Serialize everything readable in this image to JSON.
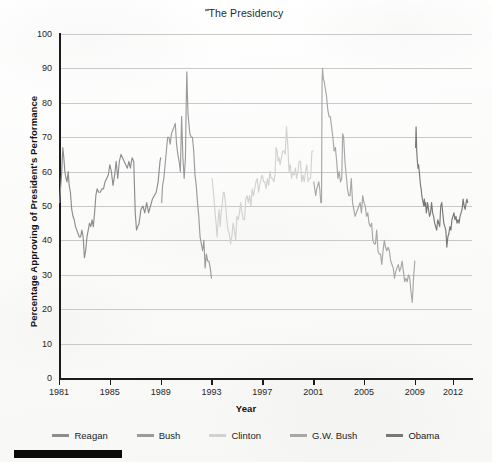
{
  "chart_title": "The Presidency",
  "axes": {
    "y_title": "Percentage Approving of President's Performance",
    "x_title": "Year",
    "y_ticks": [
      "0",
      "10",
      "20",
      "30",
      "40",
      "50",
      "60",
      "70",
      "80",
      "90",
      "100"
    ],
    "x_ticks": [
      "1981",
      "1985",
      "1989",
      "1993",
      "1997",
      "2001",
      "2005",
      "2009",
      "2012"
    ]
  },
  "legend": {
    "items": [
      {
        "label": "Reagan",
        "color": "#8d8d8d"
      },
      {
        "label": "Bush",
        "color": "#9b9b9b"
      },
      {
        "label": "Clinton",
        "color": "#d2d2d2"
      },
      {
        "label": "G.W. Bush",
        "color": "#a7a7a7"
      },
      {
        "label": "Obama",
        "color": "#787878"
      }
    ]
  },
  "chart_data": {
    "type": "line",
    "title": "The Presidency",
    "xlabel": "Year",
    "ylabel": "Percentage Approving of President's Performance",
    "xlim": [
      1981,
      2013.5
    ],
    "ylim": [
      0,
      100
    ],
    "grid": true,
    "legend_position": "bottom",
    "x_tick_values": [
      1981,
      1985,
      1989,
      1993,
      1997,
      2001,
      2005,
      2009,
      2012
    ],
    "y_tick_values": [
      0,
      10,
      20,
      30,
      40,
      50,
      60,
      70,
      80,
      90,
      100
    ],
    "series": [
      {
        "name": "Reagan",
        "color": "#8d8d8d",
        "x": [
          1981.05,
          1981.12,
          1981.2,
          1981.3,
          1981.38,
          1981.46,
          1981.55,
          1981.63,
          1981.72,
          1981.8,
          1981.9,
          1982.0,
          1982.1,
          1982.2,
          1982.3,
          1982.4,
          1982.5,
          1982.6,
          1982.7,
          1982.8,
          1982.9,
          1983.0,
          1983.1,
          1983.2,
          1983.3,
          1983.4,
          1983.5,
          1983.6,
          1983.7,
          1983.8,
          1983.9,
          1984.0,
          1984.12,
          1984.25,
          1984.38,
          1984.5,
          1984.62,
          1984.75,
          1984.88,
          1985.0,
          1985.12,
          1985.25,
          1985.38,
          1985.5,
          1985.62,
          1985.75,
          1985.88,
          1986.0,
          1986.12,
          1986.25,
          1986.38,
          1986.5,
          1986.62,
          1986.75,
          1986.88,
          1987.0,
          1987.1,
          1987.2,
          1987.3,
          1987.45,
          1987.6,
          1987.75,
          1987.9,
          1988.05,
          1988.2,
          1988.35,
          1988.5,
          1988.65,
          1988.8,
          1988.95,
          1989.0
        ],
        "y": [
          51,
          55,
          59,
          67,
          64,
          60,
          58,
          57,
          60,
          56,
          54,
          49,
          47,
          46,
          44,
          43,
          42,
          41,
          41,
          43,
          41,
          35,
          37,
          41,
          43,
          45,
          44,
          46,
          44,
          48,
          53,
          55,
          54,
          54,
          55,
          55,
          57,
          58,
          59,
          62,
          60,
          56,
          59,
          63,
          58,
          63,
          65,
          64,
          63,
          62,
          61,
          63,
          61,
          64,
          63,
          48,
          43,
          44,
          45,
          49,
          50,
          48,
          51,
          48,
          50,
          52,
          53,
          54,
          57,
          63,
          64
        ]
      },
      {
        "name": "Bush",
        "color": "#9b9b9b",
        "x": [
          1989.08,
          1989.15,
          1989.25,
          1989.35,
          1989.45,
          1989.55,
          1989.65,
          1989.75,
          1989.85,
          1989.95,
          1990.05,
          1990.15,
          1990.25,
          1990.35,
          1990.45,
          1990.55,
          1990.65,
          1990.75,
          1990.85,
          1990.95,
          1991.02,
          1991.06,
          1991.1,
          1991.15,
          1991.22,
          1991.3,
          1991.4,
          1991.5,
          1991.6,
          1991.7,
          1991.8,
          1991.9,
          1992.0,
          1992.1,
          1992.2,
          1992.3,
          1992.4,
          1992.5,
          1992.6,
          1992.7,
          1992.8,
          1992.9,
          1993.0
        ],
        "y": [
          51,
          56,
          58,
          62,
          66,
          70,
          70,
          68,
          71,
          72,
          73,
          74,
          68,
          65,
          63,
          60,
          76,
          64,
          58,
          64,
          82,
          89,
          83,
          77,
          74,
          71,
          70,
          70,
          66,
          59,
          56,
          51,
          47,
          41,
          39,
          37,
          40,
          32,
          36,
          34,
          34,
          32,
          29
        ]
      },
      {
        "name": "Clinton",
        "color": "#d2d2d2",
        "x": [
          1993.05,
          1993.12,
          1993.2,
          1993.28,
          1993.36,
          1993.44,
          1993.52,
          1993.6,
          1993.68,
          1993.76,
          1993.84,
          1993.92,
          1994.0,
          1994.1,
          1994.2,
          1994.3,
          1994.4,
          1994.5,
          1994.6,
          1994.7,
          1994.8,
          1994.9,
          1995.0,
          1995.1,
          1995.2,
          1995.3,
          1995.4,
          1995.5,
          1995.6,
          1995.7,
          1995.8,
          1995.9,
          1996.0,
          1996.1,
          1996.2,
          1996.3,
          1996.4,
          1996.5,
          1996.6,
          1996.7,
          1996.8,
          1996.9,
          1997.0,
          1997.1,
          1997.2,
          1997.3,
          1997.4,
          1997.5,
          1997.6,
          1997.7,
          1997.8,
          1997.9,
          1998.0,
          1998.08,
          1998.16,
          1998.24,
          1998.32,
          1998.4,
          1998.5,
          1998.6,
          1998.7,
          1998.8,
          1998.9,
          1999.0,
          1999.1,
          1999.2,
          1999.3,
          1999.4,
          1999.5,
          1999.6,
          1999.7,
          1999.8,
          1999.9,
          2000.0,
          2000.1,
          2000.2,
          2000.3,
          2000.4,
          2000.5,
          2000.6,
          2000.7,
          2000.8,
          2000.9,
          2001.0
        ],
        "y": [
          58,
          55,
          52,
          48,
          45,
          41,
          46,
          49,
          44,
          48,
          50,
          54,
          54,
          51,
          46,
          43,
          42,
          39,
          41,
          45,
          43,
          40,
          47,
          46,
          48,
          51,
          48,
          46,
          46,
          52,
          53,
          51,
          53,
          50,
          55,
          53,
          55,
          57,
          58,
          54,
          56,
          58,
          59,
          57,
          57,
          55,
          58,
          56,
          60,
          58,
          58,
          57,
          59,
          67,
          66,
          63,
          64,
          62,
          64,
          66,
          66,
          65,
          73,
          68,
          60,
          62,
          58,
          60,
          59,
          61,
          58,
          60,
          63,
          63,
          57,
          59,
          57,
          60,
          62,
          57,
          58,
          58,
          66,
          66
        ]
      },
      {
        "name": "G.W. Bush",
        "color": "#a7a7a7",
        "x": [
          2001.05,
          2001.12,
          2001.2,
          2001.28,
          2001.36,
          2001.44,
          2001.52,
          2001.6,
          2001.66,
          2001.7,
          2001.74,
          2001.8,
          2001.88,
          2001.96,
          2002.05,
          2002.15,
          2002.25,
          2002.35,
          2002.45,
          2002.55,
          2002.65,
          2002.75,
          2002.85,
          2002.95,
          2003.05,
          2003.15,
          2003.25,
          2003.32,
          2003.4,
          2003.5,
          2003.6,
          2003.7,
          2003.8,
          2003.9,
          2004.0,
          2004.1,
          2004.2,
          2004.3,
          2004.4,
          2004.5,
          2004.6,
          2004.7,
          2004.8,
          2004.9,
          2005.0,
          2005.1,
          2005.2,
          2005.3,
          2005.4,
          2005.5,
          2005.6,
          2005.7,
          2005.8,
          2005.9,
          2006.0,
          2006.1,
          2006.2,
          2006.3,
          2006.4,
          2006.5,
          2006.6,
          2006.7,
          2006.8,
          2006.9,
          2007.0,
          2007.1,
          2007.2,
          2007.3,
          2007.4,
          2007.5,
          2007.6,
          2007.7,
          2007.8,
          2007.9,
          2008.0,
          2008.1,
          2008.2,
          2008.3,
          2008.4,
          2008.5,
          2008.6,
          2008.7,
          2008.8,
          2008.9,
          2009.0
        ],
        "y": [
          57,
          55,
          53,
          55,
          56,
          57,
          55,
          51,
          51,
          86,
          90,
          87,
          86,
          84,
          82,
          78,
          76,
          76,
          73,
          70,
          66,
          67,
          63,
          58,
          60,
          57,
          58,
          71,
          70,
          63,
          59,
          55,
          53,
          53,
          58,
          51,
          49,
          47,
          48,
          49,
          50,
          51,
          48,
          53,
          51,
          50,
          47,
          48,
          45,
          44,
          45,
          40,
          39,
          39,
          43,
          37,
          36,
          36,
          33,
          37,
          40,
          38,
          37,
          38,
          37,
          34,
          33,
          32,
          29,
          31,
          32,
          33,
          31,
          32,
          34,
          31,
          28,
          29,
          28,
          30,
          29,
          25,
          22,
          29,
          34
        ]
      },
      {
        "name": "Obama",
        "color": "#787878",
        "x": [
          2009.06,
          2009.1,
          2009.15,
          2009.2,
          2009.25,
          2009.3,
          2009.35,
          2009.4,
          2009.45,
          2009.5,
          2009.55,
          2009.6,
          2009.65,
          2009.7,
          2009.75,
          2009.8,
          2009.85,
          2009.9,
          2009.95,
          2010.0,
          2010.08,
          2010.16,
          2010.24,
          2010.32,
          2010.4,
          2010.48,
          2010.56,
          2010.64,
          2010.72,
          2010.8,
          2010.88,
          2010.96,
          2011.04,
          2011.12,
          2011.2,
          2011.28,
          2011.36,
          2011.44,
          2011.52,
          2011.6,
          2011.68,
          2011.76,
          2011.84,
          2011.92,
          2012.0,
          2012.08,
          2012.16,
          2012.24,
          2012.32,
          2012.4,
          2012.48,
          2012.56,
          2012.64,
          2012.72,
          2012.8,
          2012.88,
          2012.96,
          2013.04,
          2013.1,
          2013.16
        ],
        "y": [
          67,
          73,
          66,
          63,
          61,
          62,
          60,
          58,
          56,
          55,
          53,
          52,
          51,
          50,
          52,
          50,
          51,
          48,
          49,
          51,
          49,
          47,
          48,
          51,
          48,
          47,
          45,
          44,
          43,
          46,
          45,
          44,
          50,
          51,
          48,
          45,
          44,
          43,
          38,
          41,
          42,
          44,
          43,
          46,
          47,
          48,
          46,
          47,
          45,
          46,
          45,
          47,
          48,
          49,
          52,
          50,
          49,
          51,
          52,
          51
        ]
      }
    ]
  }
}
